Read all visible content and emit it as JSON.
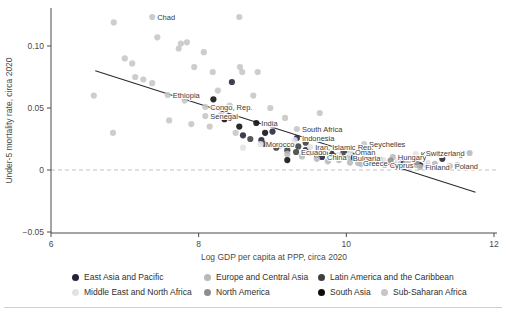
{
  "figure": {
    "background": "#ffffff",
    "text_color": "#4a4a4a"
  },
  "chart_data": {
    "type": "scatter",
    "title": "",
    "xlabel": "Log GDP per capita at PPP, circa 2020",
    "ylabel": "Under-5 mortality rate, circa 2020",
    "xlim": [
      6,
      12
    ],
    "ylim": [
      -0.05,
      0.125
    ],
    "x_ticks": [
      {
        "value": 6,
        "label": "6"
      },
      {
        "value": 8,
        "label": "8"
      },
      {
        "value": 10,
        "label": "10"
      },
      {
        "value": 12,
        "label": "12"
      }
    ],
    "y_ticks": [
      {
        "value": 0.1,
        "label": "0.10"
      },
      {
        "value": 0.05,
        "label": "0.05"
      },
      {
        "value": 0,
        "label": "0"
      },
      {
        "value": -0.05,
        "label": "−0.05"
      }
    ],
    "grid": "off",
    "zero_line": {
      "y": 0,
      "style": "dashed",
      "color": "#c2c2c2"
    },
    "trend_line": {
      "x1": 6.6,
      "y1": 0.08,
      "x2": 11.75,
      "y2": -0.018,
      "color": "#2a2a2a"
    },
    "legend_position": "bottom",
    "regions": [
      {
        "id": "eap",
        "label": "East Asia and Pacific",
        "color": "#23233b"
      },
      {
        "id": "eca",
        "label": "Europe and Central Asia",
        "color": "#b9b9b9"
      },
      {
        "id": "lac",
        "label": "Latin America and the Caribbean",
        "color": "#3f3f3f"
      },
      {
        "id": "mena",
        "label": "Middle East and North Africa",
        "color": "#e3e3e3"
      },
      {
        "id": "na",
        "label": "North America",
        "color": "#8e8e8e"
      },
      {
        "id": "sa",
        "label": "South Asia",
        "color": "#0d0d0d"
      },
      {
        "id": "ssa",
        "label": "Sub-Saharan Africa",
        "color": "#c6c6c6"
      }
    ],
    "points": [
      {
        "x": 6.85,
        "y": 0.119,
        "region": "ssa"
      },
      {
        "x": 7.37,
        "y": 0.1234,
        "region": "ssa",
        "label": "Chad"
      },
      {
        "x": 8.55,
        "y": 0.1234,
        "region": "ssa"
      },
      {
        "x": 7.44,
        "y": 0.107,
        "region": "ssa"
      },
      {
        "x": 7.76,
        "y": 0.102,
        "region": "ssa"
      },
      {
        "x": 7.84,
        "y": 0.103,
        "region": "ssa"
      },
      {
        "x": 8.07,
        "y": 0.095,
        "region": "ssa"
      },
      {
        "x": 7.73,
        "y": 0.098,
        "region": "ssa"
      },
      {
        "x": 7.0,
        "y": 0.09,
        "region": "ssa"
      },
      {
        "x": 7.1,
        "y": 0.086,
        "region": "ssa"
      },
      {
        "x": 7.94,
        "y": 0.083,
        "region": "ssa"
      },
      {
        "x": 8.19,
        "y": 0.079,
        "region": "ssa"
      },
      {
        "x": 8.56,
        "y": 0.083,
        "region": "ssa"
      },
      {
        "x": 8.59,
        "y": 0.079,
        "region": "ssa"
      },
      {
        "x": 8.8,
        "y": 0.079,
        "region": "ssa"
      },
      {
        "x": 7.14,
        "y": 0.075,
        "region": "ssa"
      },
      {
        "x": 7.25,
        "y": 0.073,
        "region": "ssa"
      },
      {
        "x": 7.37,
        "y": 0.07,
        "region": "ssa"
      },
      {
        "x": 6.58,
        "y": 0.06,
        "region": "ssa"
      },
      {
        "x": 7.58,
        "y": 0.0605,
        "region": "ssa",
        "label": "Ethiopia"
      },
      {
        "x": 8.09,
        "y": 0.0508,
        "region": "ssa",
        "label": "Congo, Rep."
      },
      {
        "x": 8.09,
        "y": 0.0435,
        "region": "ssa",
        "label": "Senegal"
      },
      {
        "x": 7.81,
        "y": 0.056,
        "region": "ssa"
      },
      {
        "x": 8.26,
        "y": 0.064,
        "region": "ssa"
      },
      {
        "x": 8.42,
        "y": 0.052,
        "region": "ssa"
      },
      {
        "x": 8.74,
        "y": 0.06,
        "region": "ssa"
      },
      {
        "x": 8.97,
        "y": 0.05,
        "region": "ssa"
      },
      {
        "x": 9.17,
        "y": 0.042,
        "region": "ssa"
      },
      {
        "x": 9.64,
        "y": 0.046,
        "region": "ssa"
      },
      {
        "x": 9.33,
        "y": 0.0331,
        "region": "ssa",
        "label": "South Africa"
      },
      {
        "x": 10.24,
        "y": 0.021,
        "region": "ssa",
        "label": "Seychelles"
      },
      {
        "x": 6.84,
        "y": 0.03,
        "region": "ssa"
      },
      {
        "x": 7.6,
        "y": 0.04,
        "region": "ssa"
      },
      {
        "x": 7.9,
        "y": 0.037,
        "region": "ssa"
      },
      {
        "x": 8.3,
        "y": 0.044,
        "region": "ssa"
      },
      {
        "x": 8.15,
        "y": 0.035,
        "region": "ssa"
      },
      {
        "x": 8.5,
        "y": 0.03,
        "region": "ssa"
      },
      {
        "x": 9.0,
        "y": 0.036,
        "region": "ssa"
      },
      {
        "x": 8.45,
        "y": 0.071,
        "region": "eap"
      },
      {
        "x": 9.33,
        "y": 0.0258,
        "region": "eap",
        "label": "Indonesia"
      },
      {
        "x": 9.67,
        "y": 0.0105,
        "region": "eap",
        "label": "China"
      },
      {
        "x": 8.6,
        "y": 0.028,
        "region": "eap"
      },
      {
        "x": 8.85,
        "y": 0.024,
        "region": "eap"
      },
      {
        "x": 9.1,
        "y": 0.02,
        "region": "eap"
      },
      {
        "x": 9.45,
        "y": 0.016,
        "region": "eap"
      },
      {
        "x": 9.8,
        "y": 0.013,
        "region": "eap"
      },
      {
        "x": 10.1,
        "y": 0.01,
        "region": "eap"
      },
      {
        "x": 10.45,
        "y": 0.008,
        "region": "eap"
      },
      {
        "x": 10.75,
        "y": 0.006,
        "region": "eap"
      },
      {
        "x": 11.0,
        "y": 0.004,
        "region": "eap"
      },
      {
        "x": 11.3,
        "y": 0.009,
        "region": "eap"
      },
      {
        "x": 11.55,
        "y": 0.0125,
        "region": "eap"
      },
      {
        "x": 9.0,
        "y": 0.031,
        "region": "eap"
      },
      {
        "x": 8.78,
        "y": 0.0379,
        "region": "sa",
        "label": "India"
      },
      {
        "x": 8.35,
        "y": 0.041,
        "region": "sa"
      },
      {
        "x": 8.55,
        "y": 0.035,
        "region": "sa"
      },
      {
        "x": 8.9,
        "y": 0.03,
        "region": "sa"
      },
      {
        "x": 9.2,
        "y": 0.008,
        "region": "sa"
      },
      {
        "x": 8.2,
        "y": 0.057,
        "region": "sa"
      },
      {
        "x": 9.32,
        "y": 0.0145,
        "region": "lac",
        "label": "Ecuador"
      },
      {
        "x": 8.9,
        "y": 0.021,
        "region": "lac"
      },
      {
        "x": 9.05,
        "y": 0.018,
        "region": "lac"
      },
      {
        "x": 9.2,
        "y": 0.016,
        "region": "lac"
      },
      {
        "x": 9.35,
        "y": 0.019,
        "region": "lac"
      },
      {
        "x": 9.5,
        "y": 0.014,
        "region": "lac"
      },
      {
        "x": 9.6,
        "y": 0.012,
        "region": "lac"
      },
      {
        "x": 9.7,
        "y": 0.015,
        "region": "lac"
      },
      {
        "x": 9.85,
        "y": 0.011,
        "region": "lac"
      },
      {
        "x": 9.95,
        "y": 0.013,
        "region": "lac"
      },
      {
        "x": 10.1,
        "y": 0.009,
        "region": "lac"
      },
      {
        "x": 10.3,
        "y": 0.007,
        "region": "lac"
      },
      {
        "x": 9.45,
        "y": 0.022,
        "region": "lac"
      },
      {
        "x": 8.7,
        "y": 0.025,
        "region": "lac"
      },
      {
        "x": 10.0,
        "y": 0.016,
        "region": "lac"
      },
      {
        "x": 8.84,
        "y": 0.021,
        "region": "mena",
        "label": "Morocco"
      },
      {
        "x": 9.51,
        "y": 0.0185,
        "region": "mena",
        "label": "Iran, Islamic Rep."
      },
      {
        "x": 10.05,
        "y": 0.0145,
        "region": "mena",
        "label": "Oman"
      },
      {
        "x": 10.94,
        "y": 0.0129,
        "region": "mena",
        "label": "Kuwait"
      },
      {
        "x": 9.3,
        "y": 0.024,
        "region": "mena"
      },
      {
        "x": 9.7,
        "y": 0.018,
        "region": "mena"
      },
      {
        "x": 9.9,
        "y": 0.012,
        "region": "mena"
      },
      {
        "x": 10.2,
        "y": 0.01,
        "region": "mena"
      },
      {
        "x": 10.5,
        "y": 0.008,
        "region": "mena"
      },
      {
        "x": 10.7,
        "y": 0.007,
        "region": "mena"
      },
      {
        "x": 11.1,
        "y": 0.006,
        "region": "mena"
      },
      {
        "x": 8.6,
        "y": 0.018,
        "region": "mena"
      },
      {
        "x": 10.02,
        "y": 0.0097,
        "region": "eca",
        "label": "Bulgaria"
      },
      {
        "x": 10.63,
        "y": 0.0105,
        "region": "eca",
        "label": "Hungary"
      },
      {
        "x": 11.67,
        "y": 0.0137,
        "region": "eca",
        "label": "Switzerland",
        "side": "left"
      },
      {
        "x": 10.16,
        "y": 0.0056,
        "region": "eca",
        "label": "Greece"
      },
      {
        "x": 10.52,
        "y": 0.004,
        "region": "eca",
        "label": "Cyprus"
      },
      {
        "x": 11.0,
        "y": 0.0024,
        "region": "eca",
        "label": "Finland"
      },
      {
        "x": 11.4,
        "y": 0.0032,
        "region": "eca",
        "label": "Poland"
      },
      {
        "x": 9.6,
        "y": 0.009,
        "region": "eca"
      },
      {
        "x": 9.75,
        "y": 0.007,
        "region": "eca"
      },
      {
        "x": 9.9,
        "y": 0.008,
        "region": "eca"
      },
      {
        "x": 10.05,
        "y": 0.006,
        "region": "eca"
      },
      {
        "x": 10.2,
        "y": 0.005,
        "region": "eca"
      },
      {
        "x": 10.35,
        "y": 0.006,
        "region": "eca"
      },
      {
        "x": 10.5,
        "y": 0.005,
        "region": "eca"
      },
      {
        "x": 10.65,
        "y": 0.004,
        "region": "eca"
      },
      {
        "x": 10.8,
        "y": 0.005,
        "region": "eca"
      },
      {
        "x": 10.95,
        "y": 0.004,
        "region": "eca"
      },
      {
        "x": 11.1,
        "y": 0.003,
        "region": "eca"
      },
      {
        "x": 11.2,
        "y": 0.005,
        "region": "eca"
      },
      {
        "x": 9.4,
        "y": 0.011,
        "region": "eca"
      },
      {
        "x": 9.2,
        "y": 0.013,
        "region": "eca"
      },
      {
        "x": 10.4,
        "y": 0.009,
        "region": "eca"
      },
      {
        "x": 10.85,
        "y": 0.008,
        "region": "eca"
      },
      {
        "x": 11.5,
        "y": 0.004,
        "region": "eca"
      },
      {
        "x": 10.95,
        "y": 0.0065,
        "region": "na"
      },
      {
        "x": 10.6,
        "y": 0.0075,
        "region": "na"
      }
    ]
  },
  "legend": {
    "rows": [
      [
        "eap",
        "eca",
        "lac"
      ],
      [
        "mena",
        "na",
        "sa",
        "ssa"
      ]
    ]
  }
}
